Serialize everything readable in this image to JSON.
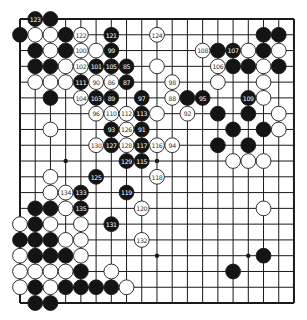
{
  "diagram": {
    "type": "go-board",
    "size": 19,
    "grid": {
      "x0": 20,
      "y0": 19,
      "dx": 15.22,
      "dy": 15.78,
      "stone_radius": 7.4
    },
    "colors": {
      "background": "#ffffff",
      "line": "#1a1a1a",
      "black_stone": "#141414",
      "white_stone": "#ffffff",
      "black_label": "#ffffff",
      "white_label": "#333333"
    },
    "star_points": [
      [
        3,
        3
      ],
      [
        9,
        3
      ],
      [
        15,
        3
      ],
      [
        3,
        9
      ],
      [
        9,
        9
      ],
      [
        15,
        9
      ],
      [
        3,
        15
      ],
      [
        9,
        15
      ],
      [
        15,
        15
      ]
    ],
    "stones": [
      {
        "c": 1,
        "r": 0,
        "color": "B",
        "label": "123"
      },
      {
        "c": 2,
        "r": 0,
        "color": "B",
        "label": ""
      },
      {
        "c": 0,
        "r": 1,
        "color": "B",
        "label": ""
      },
      {
        "c": 1,
        "r": 1,
        "color": "W",
        "label": ""
      },
      {
        "c": 2,
        "r": 1,
        "color": "W",
        "label": ""
      },
      {
        "c": 3,
        "r": 1,
        "color": "B",
        "label": ""
      },
      {
        "c": 4,
        "r": 1,
        "color": "W",
        "label": "122"
      },
      {
        "c": 6,
        "r": 1,
        "color": "B",
        "label": "121"
      },
      {
        "c": 9,
        "r": 1,
        "color": "W",
        "label": "124"
      },
      {
        "c": 16,
        "r": 1,
        "color": "B",
        "label": ""
      },
      {
        "c": 17,
        "r": 1,
        "color": "B",
        "label": ""
      },
      {
        "c": 1,
        "r": 2,
        "color": "B",
        "label": ""
      },
      {
        "c": 2,
        "r": 2,
        "color": "W",
        "label": ""
      },
      {
        "c": 3,
        "r": 2,
        "color": "B",
        "label": ""
      },
      {
        "c": 4,
        "r": 2,
        "color": "W",
        "label": "100"
      },
      {
        "c": 5,
        "r": 2,
        "color": "W",
        "label": ""
      },
      {
        "c": 6,
        "r": 2,
        "color": "B",
        "label": "99"
      },
      {
        "c": 12,
        "r": 2,
        "color": "W",
        "label": "108"
      },
      {
        "c": 13,
        "r": 2,
        "color": "B",
        "label": ""
      },
      {
        "c": 14,
        "r": 2,
        "color": "B",
        "label": "107"
      },
      {
        "c": 15,
        "r": 2,
        "color": "W",
        "label": ""
      },
      {
        "c": 16,
        "r": 2,
        "color": "B",
        "label": ""
      },
      {
        "c": 17,
        "r": 2,
        "color": "W",
        "label": ""
      },
      {
        "c": 1,
        "r": 3,
        "color": "B",
        "label": ""
      },
      {
        "c": 2,
        "r": 3,
        "color": "B",
        "label": ""
      },
      {
        "c": 3,
        "r": 3,
        "color": "W",
        "label": ""
      },
      {
        "c": 4,
        "r": 3,
        "color": "W",
        "label": "102"
      },
      {
        "c": 5,
        "r": 3,
        "color": "B",
        "label": "101"
      },
      {
        "c": 6,
        "r": 3,
        "color": "B",
        "label": "105"
      },
      {
        "c": 7,
        "r": 3,
        "color": "B",
        "label": "85"
      },
      {
        "c": 9,
        "r": 3,
        "color": "W",
        "label": ""
      },
      {
        "c": 13,
        "r": 3,
        "color": "W",
        "label": "106"
      },
      {
        "c": 14,
        "r": 3,
        "color": "B",
        "label": ""
      },
      {
        "c": 15,
        "r": 3,
        "color": "B",
        "label": ""
      },
      {
        "c": 16,
        "r": 3,
        "color": "W",
        "label": ""
      },
      {
        "c": 17,
        "r": 3,
        "color": "B",
        "label": ""
      },
      {
        "c": 1,
        "r": 4,
        "color": "W",
        "label": ""
      },
      {
        "c": 2,
        "r": 4,
        "color": "W",
        "label": ""
      },
      {
        "c": 3,
        "r": 4,
        "color": "W",
        "label": ""
      },
      {
        "c": 4,
        "r": 4,
        "color": "B",
        "label": "111"
      },
      {
        "c": 5,
        "r": 4,
        "color": "W",
        "label": "90"
      },
      {
        "c": 6,
        "r": 4,
        "color": "W",
        "label": "86"
      },
      {
        "c": 7,
        "r": 4,
        "color": "B",
        "label": "87"
      },
      {
        "c": 10,
        "r": 4,
        "color": "W",
        "label": "98"
      },
      {
        "c": 13,
        "r": 4,
        "color": "W",
        "label": ""
      },
      {
        "c": 16,
        "r": 4,
        "color": "W",
        "label": ""
      },
      {
        "c": 2,
        "r": 5,
        "color": "B",
        "label": ""
      },
      {
        "c": 4,
        "r": 5,
        "color": "W",
        "label": "104"
      },
      {
        "c": 5,
        "r": 5,
        "color": "B",
        "label": "103"
      },
      {
        "c": 6,
        "r": 5,
        "color": "B",
        "label": "89"
      },
      {
        "c": 8,
        "r": 5,
        "color": "B",
        "label": "97"
      },
      {
        "c": 10,
        "r": 5,
        "color": "W",
        "label": "88"
      },
      {
        "c": 11,
        "r": 5,
        "color": "B",
        "label": ""
      },
      {
        "c": 12,
        "r": 5,
        "color": "B",
        "label": "95"
      },
      {
        "c": 15,
        "r": 5,
        "color": "B",
        "label": "109"
      },
      {
        "c": 16,
        "r": 5,
        "color": "W",
        "label": ""
      },
      {
        "c": 5,
        "r": 6,
        "color": "W",
        "label": "96"
      },
      {
        "c": 6,
        "r": 6,
        "color": "W",
        "label": "110"
      },
      {
        "c": 7,
        "r": 6,
        "color": "W",
        "label": "112"
      },
      {
        "c": 8,
        "r": 6,
        "color": "B",
        "label": "113"
      },
      {
        "c": 9,
        "r": 6,
        "color": "W",
        "label": ""
      },
      {
        "c": 11,
        "r": 6,
        "color": "W",
        "label": "92"
      },
      {
        "c": 13,
        "r": 6,
        "color": "B",
        "label": ""
      },
      {
        "c": 15,
        "r": 6,
        "color": "B",
        "label": ""
      },
      {
        "c": 17,
        "r": 6,
        "color": "W",
        "label": ""
      },
      {
        "c": 2,
        "r": 7,
        "color": "W",
        "label": ""
      },
      {
        "c": 6,
        "r": 7,
        "color": "B",
        "label": "93"
      },
      {
        "c": 7,
        "r": 7,
        "color": "W",
        "label": "126"
      },
      {
        "c": 8,
        "r": 7,
        "color": "B",
        "label": "91"
      },
      {
        "c": 14,
        "r": 7,
        "color": "B",
        "label": ""
      },
      {
        "c": 16,
        "r": 7,
        "color": "B",
        "label": ""
      },
      {
        "c": 17,
        "r": 7,
        "color": "W",
        "label": ""
      },
      {
        "c": 5,
        "r": 8,
        "color": "W",
        "label": "130"
      },
      {
        "c": 6,
        "r": 8,
        "color": "B",
        "label": "127"
      },
      {
        "c": 7,
        "r": 8,
        "color": "W",
        "label": "128"
      },
      {
        "c": 8,
        "r": 8,
        "color": "B",
        "label": "117"
      },
      {
        "c": 9,
        "r": 8,
        "color": "W",
        "label": "116"
      },
      {
        "c": 10,
        "r": 8,
        "color": "W",
        "label": "94"
      },
      {
        "c": 13,
        "r": 8,
        "color": "B",
        "label": ""
      },
      {
        "c": 15,
        "r": 8,
        "color": "B",
        "label": ""
      },
      {
        "c": 7,
        "r": 9,
        "color": "B",
        "label": "129"
      },
      {
        "c": 8,
        "r": 9,
        "color": "B",
        "label": "115"
      },
      {
        "c": 14,
        "r": 9,
        "color": "W",
        "label": ""
      },
      {
        "c": 15,
        "r": 9,
        "color": "W",
        "label": ""
      },
      {
        "c": 16,
        "r": 9,
        "color": "W",
        "label": ""
      },
      {
        "c": 2,
        "r": 10,
        "color": "W",
        "label": ""
      },
      {
        "c": 5,
        "r": 10,
        "color": "B",
        "label": "125"
      },
      {
        "c": 9,
        "r": 10,
        "color": "W",
        "label": "118"
      },
      {
        "c": 2,
        "r": 11,
        "color": "W",
        "label": ""
      },
      {
        "c": 3,
        "r": 11,
        "color": "W",
        "label": "134"
      },
      {
        "c": 4,
        "r": 11,
        "color": "B",
        "label": "133"
      },
      {
        "c": 7,
        "r": 11,
        "color": "B",
        "label": "119"
      },
      {
        "c": 1,
        "r": 12,
        "color": "B",
        "label": ""
      },
      {
        "c": 2,
        "r": 12,
        "color": "B",
        "label": ""
      },
      {
        "c": 3,
        "r": 12,
        "color": "W",
        "label": ""
      },
      {
        "c": 4,
        "r": 12,
        "color": "B",
        "label": "135"
      },
      {
        "c": 8,
        "r": 12,
        "color": "W",
        "label": "120"
      },
      {
        "c": 16,
        "r": 12,
        "color": "W",
        "label": ""
      },
      {
        "c": 0,
        "r": 13,
        "color": "W",
        "label": ""
      },
      {
        "c": 1,
        "r": 13,
        "color": "B",
        "label": ""
      },
      {
        "c": 2,
        "r": 13,
        "color": "W",
        "label": ""
      },
      {
        "c": 4,
        "r": 13,
        "color": "W",
        "label": ""
      },
      {
        "c": 6,
        "r": 13,
        "color": "B",
        "label": "131"
      },
      {
        "c": 0,
        "r": 14,
        "color": "B",
        "label": ""
      },
      {
        "c": 1,
        "r": 14,
        "color": "B",
        "label": ""
      },
      {
        "c": 2,
        "r": 14,
        "color": "B",
        "label": ""
      },
      {
        "c": 3,
        "r": 14,
        "color": "W",
        "label": ""
      },
      {
        "c": 4,
        "r": 14,
        "color": "W",
        "label": ""
      },
      {
        "c": 8,
        "r": 14,
        "color": "W",
        "label": "132"
      },
      {
        "c": 0,
        "r": 15,
        "color": "W",
        "label": ""
      },
      {
        "c": 1,
        "r": 15,
        "color": "B",
        "label": ""
      },
      {
        "c": 2,
        "r": 15,
        "color": "B",
        "label": ""
      },
      {
        "c": 3,
        "r": 15,
        "color": "B",
        "label": ""
      },
      {
        "c": 4,
        "r": 15,
        "color": "W",
        "label": ""
      },
      {
        "c": 16,
        "r": 15,
        "color": "B",
        "label": ""
      },
      {
        "c": 0,
        "r": 16,
        "color": "W",
        "label": ""
      },
      {
        "c": 1,
        "r": 16,
        "color": "W",
        "label": ""
      },
      {
        "c": 2,
        "r": 16,
        "color": "W",
        "label": ""
      },
      {
        "c": 3,
        "r": 16,
        "color": "W",
        "label": ""
      },
      {
        "c": 4,
        "r": 16,
        "color": "B",
        "label": ""
      },
      {
        "c": 6,
        "r": 16,
        "color": "W",
        "label": ""
      },
      {
        "c": 14,
        "r": 16,
        "color": "B",
        "label": ""
      },
      {
        "c": 0,
        "r": 17,
        "color": "W",
        "label": ""
      },
      {
        "c": 1,
        "r": 17,
        "color": "B",
        "label": ""
      },
      {
        "c": 2,
        "r": 17,
        "color": "W",
        "label": ""
      },
      {
        "c": 3,
        "r": 17,
        "color": "B",
        "label": ""
      },
      {
        "c": 4,
        "r": 17,
        "color": "B",
        "label": ""
      },
      {
        "c": 5,
        "r": 17,
        "color": "B",
        "label": ""
      },
      {
        "c": 6,
        "r": 17,
        "color": "B",
        "label": ""
      },
      {
        "c": 7,
        "r": 17,
        "color": "W",
        "label": ""
      },
      {
        "c": 1,
        "r": 18,
        "color": "B",
        "label": ""
      },
      {
        "c": 2,
        "r": 18,
        "color": "B",
        "label": ""
      }
    ]
  }
}
